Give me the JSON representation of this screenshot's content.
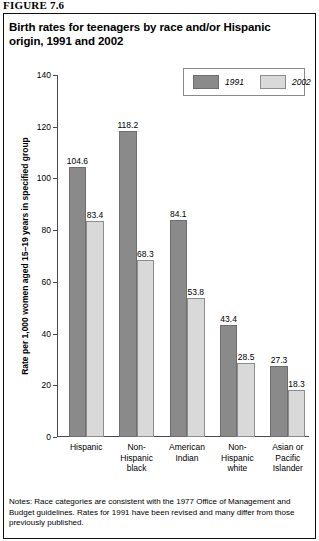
{
  "figure": {
    "number": "FIGURE 7.6",
    "title": "Birth rates for teenagers by race and/or Hispanic origin, 1991 and 2002",
    "notes": "Notes: Race categories are consistent with the 1977 Office of Management and Budget guidelines. Rates for 1991 have been revised and many differ from those previously published."
  },
  "legend": {
    "items": [
      {
        "label": "1991",
        "color": "#8a8a8a"
      },
      {
        "label": "2002",
        "color": "#d9d9d9"
      }
    ]
  },
  "chart_data": {
    "type": "bar",
    "title": "Birth rates for teenagers by race and/or Hispanic origin, 1991 and 2002",
    "xlabel": "",
    "ylabel": "Rate per 1,000 women aged 15–19 years in specified group",
    "ylim": [
      0,
      140
    ],
    "yticks": [
      0,
      20,
      40,
      60,
      80,
      100,
      120,
      140
    ],
    "ytick_labels": [
      "0",
      "20",
      "40",
      "60",
      "80",
      "100",
      "120",
      "140"
    ],
    "grid": false,
    "legend_position": "top-right",
    "categories": [
      "Hispanic",
      "Non-\nHispanic\nblack",
      "American\nIndian",
      "Non-\nHispanic\nwhite",
      "Asian or\nPacific\nIslander"
    ],
    "series": [
      {
        "name": "1991",
        "color": "#8a8a8a",
        "values": [
          104.6,
          118.2,
          84.1,
          43.4,
          27.3
        ],
        "value_labels": [
          "104.6",
          "118.2",
          "84.1",
          "43.4",
          "27.3"
        ]
      },
      {
        "name": "2002",
        "color": "#d9d9d9",
        "values": [
          83.4,
          68.3,
          53.8,
          28.5,
          18.3
        ],
        "value_labels": [
          "83.4",
          "68.3",
          "53.8",
          "28.5",
          "18.3"
        ]
      }
    ]
  }
}
